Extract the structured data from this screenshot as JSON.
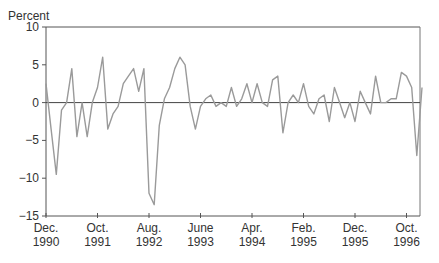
{
  "chart_data": {
    "type": "line",
    "title": "",
    "ylabel": "Percent",
    "xlabel": "",
    "ylim": [
      -15,
      10
    ],
    "yticks": [
      10,
      5,
      0,
      -5,
      -10,
      -15
    ],
    "grid": false,
    "zero_line": true,
    "legend": null,
    "x_start": "Dec. 1990",
    "frequency": "monthly",
    "xtick_labels": [
      {
        "month": "Dec.",
        "year": "1990",
        "index": 0
      },
      {
        "month": "Oct.",
        "year": "1991",
        "index": 10
      },
      {
        "month": "Aug.",
        "year": "1992",
        "index": 20
      },
      {
        "month": "June",
        "year": "1993",
        "index": 30
      },
      {
        "month": "Apr.",
        "year": "1994",
        "index": 40
      },
      {
        "month": "Feb.",
        "year": "1995",
        "index": 50
      },
      {
        "month": "Dec.",
        "year": "1995",
        "index": 60
      },
      {
        "month": "Oct.",
        "year": "1996",
        "index": 70
      }
    ],
    "series": [
      {
        "name": "Percent change",
        "color": "#9a9a9a",
        "values": [
          2.5,
          -3.5,
          -9.5,
          -1.0,
          0.0,
          4.5,
          -4.5,
          0.0,
          -4.5,
          0.0,
          2.0,
          6.0,
          -3.5,
          -1.5,
          -0.5,
          2.5,
          3.5,
          4.5,
          1.5,
          4.5,
          -12.0,
          -13.5,
          -3.0,
          0.5,
          2.0,
          4.5,
          6.0,
          5.0,
          -0.5,
          -3.5,
          -0.5,
          0.5,
          1.0,
          -0.5,
          0.0,
          -0.5,
          2.0,
          -0.5,
          0.5,
          2.5,
          0.0,
          2.5,
          0.0,
          -0.5,
          3.0,
          3.5,
          -4.0,
          0.0,
          1.0,
          0.0,
          2.5,
          -0.5,
          -1.5,
          0.5,
          1.0,
          -2.5,
          2.0,
          0.0,
          -2.0,
          0.0,
          -2.5,
          1.5,
          0.0,
          -1.5,
          3.5,
          0.0,
          0.0,
          0.5,
          0.5,
          4.0,
          3.5,
          2.0,
          -7.0,
          2.0
        ]
      }
    ]
  }
}
